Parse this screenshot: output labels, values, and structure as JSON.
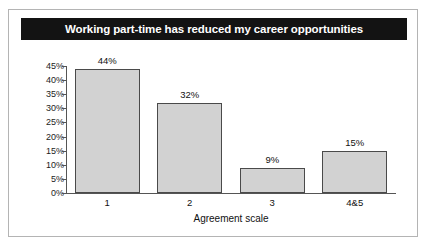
{
  "figure": {
    "title": "Working part-time has reduced my career opportunities",
    "background_color": "#ffffff",
    "border_color": "#b4b4b4",
    "title_bar_color": "#131313",
    "title_text_color": "#ffffff"
  },
  "chart_data": {
    "type": "bar",
    "title": "Working part-time has reduced my career opportunities",
    "xlabel": "Agreement scale",
    "ylabel": "",
    "categories": [
      "1",
      "2",
      "3",
      "4&5"
    ],
    "values": [
      44,
      32,
      9,
      15
    ],
    "value_labels": [
      "44%",
      "32%",
      "9%",
      "15%"
    ],
    "ylim": [
      0,
      45
    ],
    "ytick_values": [
      0,
      5,
      10,
      15,
      20,
      25,
      30,
      35,
      40,
      45
    ],
    "ytick_labels": [
      "0%",
      "5%",
      "10%",
      "15%",
      "20%",
      "25%",
      "30%",
      "35%",
      "40%",
      "45%"
    ],
    "grid": false,
    "legend": null,
    "bar_fill_color": "#d2d2d2",
    "bar_edge_color": "#4a4a4a",
    "axis_color": "#555555"
  }
}
